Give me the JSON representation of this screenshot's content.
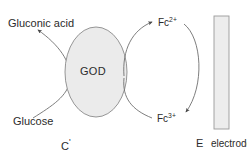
{
  "diagram": {
    "colors": {
      "stroke": "#6f6f6f",
      "text": "#2b2b2b",
      "enzyme_fill": "#ebebeb",
      "enzyme_stroke": "#8a8a8a",
      "electrode_fill": "#ededed",
      "electrode_stroke": "#9a9a9a",
      "background": "#ffffff"
    },
    "labels": {
      "gluconic_acid": "Gluconic acid",
      "glucose": "Glucose",
      "enzyme": "GOD",
      "mediator_reduced": "Fc",
      "mediator_reduced_charge": "2+",
      "mediator_oxidized": "Fc",
      "mediator_oxidized_charge": "3+",
      "compartment_c": "C",
      "compartment_c_prime": "'",
      "compartment_e": "E",
      "electrode": "electrode"
    },
    "shapes": {
      "enzyme_shape": "ellipse",
      "electrode_shape": "vertical-bar"
    },
    "arrows": [
      {
        "name": "glucose-to-gluconic-acid",
        "from": "Glucose",
        "to": "Gluconic acid"
      },
      {
        "name": "god-to-fc2",
        "from": "GOD",
        "to": "Fc2+"
      },
      {
        "name": "fc2-to-fc3",
        "from": "Fc2+",
        "to": "Fc3+"
      }
    ]
  }
}
